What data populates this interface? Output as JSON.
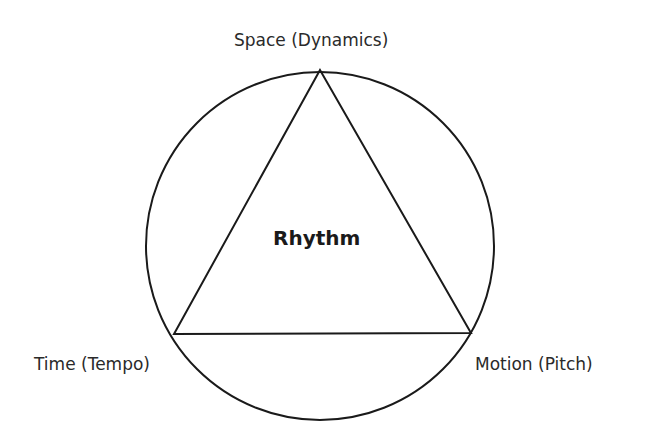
{
  "diagram": {
    "center_label": "Rhythm",
    "vertices": {
      "top": "Space (Dynamics)",
      "left": "Time (Tempo)",
      "right": "Motion (Pitch)"
    },
    "stroke_color": "#1a1a1a"
  }
}
